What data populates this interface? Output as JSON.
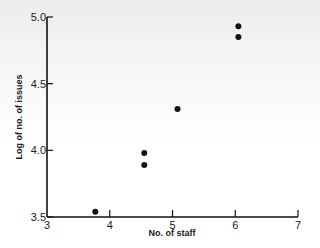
{
  "chart_data": {
    "type": "scatter",
    "title": "",
    "xlabel": "No. of staff",
    "ylabel": "Log of no. of issues",
    "xlim": [
      3,
      7
    ],
    "ylim": [
      3.5,
      5.0
    ],
    "xticks": [
      3,
      4,
      5,
      6,
      7
    ],
    "xtick_labels": [
      "3",
      "4",
      "5",
      "6",
      "7"
    ],
    "yticks": [
      3.5,
      4.0,
      4.5,
      5.0
    ],
    "ytick_labels": [
      "3.5",
      "4.0",
      "4.5",
      "5.0"
    ],
    "grid": false,
    "legend": null,
    "series": [
      {
        "name": "data",
        "color": "#111111",
        "points": [
          {
            "x": 3.77,
            "y": 3.54
          },
          {
            "x": 4.55,
            "y": 3.98
          },
          {
            "x": 4.55,
            "y": 3.89
          },
          {
            "x": 5.08,
            "y": 4.31
          },
          {
            "x": 6.05,
            "y": 4.93
          },
          {
            "x": 6.05,
            "y": 4.85
          }
        ]
      }
    ]
  }
}
